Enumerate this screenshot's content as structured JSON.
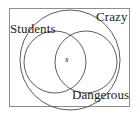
{
  "figure": {
    "type": "venn-euler-diagram",
    "frame": {
      "visible": true,
      "border_color": "#8d8d8d"
    },
    "stroke_color": "#4a4a4a",
    "fill_color": "#ffffff",
    "sets": [
      {
        "id": "crazy",
        "label": "Crazy",
        "role": "outer-universe-circle",
        "label_position": "top-right"
      },
      {
        "id": "students",
        "label": "Students",
        "role": "inner-left-circle",
        "label_position": "top-left"
      },
      {
        "id": "dangerous",
        "label": "Dangerous",
        "role": "inner-right-circle",
        "label_position": "bottom-right"
      }
    ],
    "intersection": {
      "label": "s",
      "between": [
        "students",
        "dangerous"
      ],
      "style": "italic"
    }
  }
}
